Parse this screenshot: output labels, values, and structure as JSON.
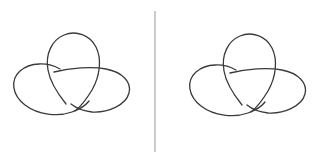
{
  "figure": {
    "background_color": "#ffffff",
    "width": 321,
    "height": 162,
    "caption": "Two knot diagrams separated by a vertical rule"
  },
  "style": {
    "stroke_color": "#3a3a3a",
    "stroke_width": 1.3,
    "divider_color": "#9a9a9a",
    "divider_width": 1.0
  },
  "divider": {
    "label": "vertical divider rule",
    "x": 155,
    "y_top": 11,
    "y_bottom": 152
  },
  "diagrams": [
    {
      "id": "left-knot",
      "label": "Trefoil knot diagram (left)",
      "center_x": 72,
      "center_y": 82,
      "crossings": 3,
      "components": 1,
      "loops": [
        {
          "name": "top-loop",
          "orientation": "vertical"
        },
        {
          "name": "left-loop",
          "orientation": "horizontal"
        },
        {
          "name": "right-loop",
          "orientation": "horizontal"
        }
      ],
      "crossing_pattern": [
        "over",
        "under",
        "over"
      ]
    },
    {
      "id": "right-knot",
      "label": "Trefoil knot diagram (right)",
      "center_x": 247,
      "center_y": 82,
      "crossings": 3,
      "components": 1,
      "loops": [
        {
          "name": "top-loop",
          "orientation": "vertical"
        },
        {
          "name": "left-loop",
          "orientation": "horizontal"
        },
        {
          "name": "right-loop",
          "orientation": "horizontal"
        }
      ],
      "crossing_pattern": [
        "under",
        "over",
        "under"
      ]
    }
  ]
}
